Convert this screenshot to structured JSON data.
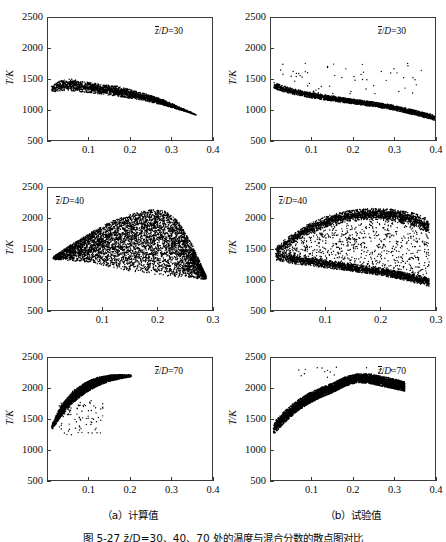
{
  "figure": {
    "caption": "图 5-27  z̄/D=30、40、70 处的温度与混合分数的散点图对比",
    "subcaptions": [
      {
        "label": "（a）计算值"
      },
      {
        "label": "（b）试验值"
      }
    ],
    "axis": {
      "ylabel": "T/K",
      "yticks": [
        "2500",
        "2000",
        "1500",
        "1000",
        "500"
      ],
      "yvalues": [
        2500,
        2000,
        1500,
        1000,
        500
      ],
      "xticks_04": [
        "0.1",
        "0.2",
        "0.3",
        "0.4"
      ],
      "xticks_03": [
        "0.1",
        "0.2",
        "0.3"
      ]
    }
  },
  "chart_data": [
    {
      "id": "calc-30",
      "type": "scatter",
      "title": "",
      "annotation": "z̄/D=30",
      "annotation_z": "z̄",
      "annotation_rest": "/D=30",
      "annotation_pos": "top-right",
      "column": "a",
      "column_label": "（a）计算值",
      "xlabel": "",
      "ylabel": "T/K",
      "xlim": [
        0,
        0.4
      ],
      "ylim": [
        500,
        2500
      ],
      "xticks": [
        0.1,
        0.2,
        0.3,
        0.4
      ],
      "yticks": [
        500,
        1000,
        1500,
        2000,
        2500
      ],
      "grid": false,
      "legend": "none",
      "marker": "filled-circle",
      "marker_color": "#000000",
      "description": "Dense narrow band from (0.01,1340) rising slightly to peak ~1420 near x=0.05 then descending linearly to (0.36,910); thin tail beyond x=0.30.",
      "band": {
        "x_start": 0.008,
        "x_end": 0.362,
        "knots_x": [
          0.008,
          0.03,
          0.055,
          0.09,
          0.13,
          0.17,
          0.2,
          0.24,
          0.28,
          0.32,
          0.362
        ],
        "knots_y": [
          1335,
          1390,
          1405,
          1370,
          1330,
          1300,
          1255,
          1195,
          1120,
          1020,
          912
        ],
        "halfwidth": [
          55,
          80,
          95,
          85,
          78,
          80,
          70,
          55,
          45,
          22,
          4
        ],
        "n_points": 2600
      }
    },
    {
      "id": "exp-30",
      "type": "scatter",
      "annotation": "z̄/D=30",
      "annotation_z": "z̄",
      "annotation_rest": "/D=30",
      "annotation_pos": "top-right",
      "column": "b",
      "column_label": "（b）试验值",
      "xlabel": "",
      "ylabel": "T/K",
      "xlim": [
        0,
        0.4
      ],
      "ylim": [
        500,
        2500
      ],
      "xticks": [
        0.1,
        0.2,
        0.3,
        0.4
      ],
      "yticks": [
        500,
        1000,
        1500,
        2000,
        2500
      ],
      "grid": false,
      "legend": "none",
      "marker": "filled-circle",
      "marker_color": "#000000",
      "description": "Tight descending band from (0.01,1390) to (0.40,860) with scattered outlier points up to 1750 between x=0.03-0.12 and a second sparse cluster near x=0.25-0.36 up to 1600.",
      "band": {
        "x_start": 0.006,
        "x_end": 0.4,
        "knots_x": [
          0.006,
          0.05,
          0.1,
          0.15,
          0.2,
          0.25,
          0.3,
          0.35,
          0.4
        ],
        "knots_y": [
          1390,
          1300,
          1230,
          1180,
          1130,
          1085,
          1030,
          950,
          865
        ],
        "halfwidth": [
          50,
          45,
          42,
          40,
          38,
          38,
          38,
          38,
          40
        ],
        "n_points": 3000
      },
      "outliers": {
        "count": 60,
        "x_range": [
          0.02,
          0.38
        ],
        "y_range": [
          1250,
          1760
        ]
      }
    },
    {
      "id": "calc-40",
      "type": "scatter",
      "annotation": "z̄/D=40",
      "annotation_z": "z̄",
      "annotation_rest": "/D=40",
      "annotation_pos": "top-left",
      "column": "a",
      "column_label": "（a）计算值",
      "xlabel": "",
      "ylabel": "T/K",
      "xlim": [
        0,
        0.3
      ],
      "ylim": [
        500,
        2500
      ],
      "xticks": [
        0.1,
        0.2,
        0.3
      ],
      "yticks": [
        500,
        1000,
        1500,
        2000,
        2500
      ],
      "grid": false,
      "legend": "none",
      "marker": "filled-circle",
      "marker_color": "#000000",
      "description": "Broad triangular cloud: upper envelope rises from (0.01,1360) to peak ~2150 at x=0.19 then falls to (0.29,1050); lower envelope near 1330 flat to x=0.12 then dips to 1000 at x=0.29. Filled densely in between.",
      "upper": {
        "knots_x": [
          0.008,
          0.04,
          0.08,
          0.12,
          0.16,
          0.19,
          0.215,
          0.24,
          0.265,
          0.29
        ],
        "knots_y": [
          1370,
          1560,
          1780,
          1970,
          2090,
          2150,
          2120,
          1950,
          1560,
          1060
        ]
      },
      "lower": {
        "knots_x": [
          0.008,
          0.04,
          0.08,
          0.12,
          0.16,
          0.19,
          0.215,
          0.24,
          0.265,
          0.29
        ],
        "knots_y": [
          1325,
          1310,
          1270,
          1180,
          1120,
          1080,
          1060,
          1040,
          1020,
          1000
        ]
      },
      "n_points": 5200
    },
    {
      "id": "exp-40",
      "type": "scatter",
      "annotation": "z̄/D=40",
      "annotation_z": "z̄",
      "annotation_rest": "/D=40",
      "annotation_pos": "top-left",
      "column": "b",
      "column_label": "（b）试验值",
      "xlabel": "",
      "ylabel": "T/K",
      "xlim": [
        0,
        0.3
      ],
      "ylim": [
        500,
        2500
      ],
      "xticks": [
        0.1,
        0.2,
        0.3
      ],
      "yticks": [
        500,
        1000,
        1500,
        2000,
        2500
      ],
      "grid": false,
      "legend": "none",
      "marker": "filled-circle",
      "marker_color": "#000000",
      "description": "Bimodal: a dense lower branch descending from (0.01,1400) to (0.29,960), plus a dense upper branch rising from (0.01,1500) to a plateau ~2050 between x=0.15-0.25; sparse scattered points fill the region between the two branches.",
      "upper": {
        "knots_x": [
          0.008,
          0.03,
          0.06,
          0.1,
          0.14,
          0.18,
          0.22,
          0.26,
          0.29
        ],
        "knots_y": [
          1470,
          1620,
          1790,
          1950,
          2040,
          2080,
          2060,
          1990,
          1880
        ],
        "halfwidth": [
          60,
          70,
          80,
          85,
          85,
          85,
          90,
          100,
          110
        ]
      },
      "lower": {
        "knots_x": [
          0.008,
          0.04,
          0.08,
          0.12,
          0.16,
          0.2,
          0.24,
          0.29
        ],
        "knots_y": [
          1390,
          1330,
          1280,
          1230,
          1180,
          1130,
          1060,
          960
        ],
        "halfwidth": [
          75,
          70,
          65,
          62,
          60,
          60,
          62,
          70
        ]
      },
      "fill": {
        "count": 900
      },
      "n_points": 5000
    },
    {
      "id": "calc-70",
      "type": "scatter",
      "annotation": "z̄/D=70",
      "annotation_z": "z̄",
      "annotation_rest": "/D=70",
      "annotation_pos": "top-right",
      "column": "a",
      "column_label": "（a）计算值",
      "xlabel": "",
      "ylabel": "T/K",
      "xlim": [
        0,
        0.4
      ],
      "ylim": [
        500,
        2500
      ],
      "xticks": [
        0.1,
        0.2,
        0.3,
        0.4
      ],
      "yticks": [
        500,
        1000,
        1500,
        2000,
        2500
      ],
      "grid": false,
      "legend": "none",
      "marker": "filled-circle",
      "marker_color": "#000000",
      "description": "Narrow steeply rising band from (0.01,1350) to (0.20,2200), thick near the start and tapering; a sparse spray of points below the band between x=0.03 and x=0.13 down to 1240.",
      "band": {
        "x_start": 0.008,
        "x_end": 0.203,
        "knots_x": [
          0.008,
          0.03,
          0.06,
          0.09,
          0.12,
          0.15,
          0.18,
          0.203
        ],
        "knots_y": [
          1360,
          1620,
          1860,
          2010,
          2110,
          2170,
          2195,
          2205
        ],
        "halfwidth": [
          45,
          90,
          95,
          85,
          70,
          50,
          30,
          12
        ],
        "n_points": 4200
      },
      "outliers": {
        "count": 90,
        "x_range": [
          0.025,
          0.135
        ],
        "y_range": [
          1240,
          1800
        ]
      }
    },
    {
      "id": "exp-70",
      "type": "scatter",
      "annotation": "z̄/D=70",
      "annotation_z": "z̄",
      "annotation_rest": "/D=70",
      "annotation_pos": "top-right",
      "column": "b",
      "column_label": "（b）试验值",
      "xlabel": "",
      "ylabel": "T/K",
      "xlim": [
        0,
        0.4
      ],
      "ylim": [
        500,
        2500
      ],
      "xticks": [
        0.1,
        0.2,
        0.3,
        0.4
      ],
      "yticks": [
        500,
        1000,
        1500,
        2000,
        2500
      ],
      "grid": false,
      "legend": "none",
      "marker": "filled-circle",
      "marker_color": "#000000",
      "description": "Thick arched band rising from (0.005,1330) to a broad maximum ~2180 near x=0.20-0.24, then slowly declining to (0.325,2020); a few isolated points above reaching 2350.",
      "band": {
        "x_start": 0.005,
        "x_end": 0.327,
        "knots_x": [
          0.005,
          0.03,
          0.06,
          0.09,
          0.12,
          0.15,
          0.18,
          0.21,
          0.24,
          0.27,
          0.3,
          0.327
        ],
        "knots_y": [
          1340,
          1520,
          1700,
          1830,
          1930,
          2010,
          2110,
          2170,
          2160,
          2120,
          2075,
          2030
        ],
        "halfwidth": [
          95,
          95,
          90,
          85,
          80,
          78,
          75,
          72,
          75,
          80,
          80,
          75
        ],
        "n_points": 6000
      },
      "outliers": {
        "count": 22,
        "x_range": [
          0.06,
          0.3
        ],
        "y_range": [
          2180,
          2360
        ]
      }
    }
  ]
}
